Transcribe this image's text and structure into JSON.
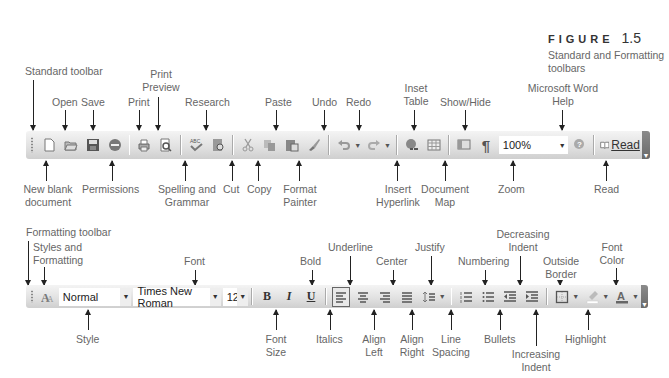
{
  "figure": {
    "label": "FIGURE",
    "number": "1.5",
    "caption": "Standard and Formatting toolbars"
  },
  "standard_toolbar": {
    "title": "Standard toolbar",
    "zoom_value": "100%",
    "read_label": "Read",
    "callouts_top": {
      "open": "Open",
      "save": "Save",
      "print": "Print",
      "print_preview": "Print Preview",
      "research": "Research",
      "paste": "Paste",
      "undo": "Undo",
      "redo": "Redo",
      "insert_table": "Inset Table",
      "show_hide": "Show/Hide",
      "help": "Microsoft Word Help"
    },
    "callouts_bottom": {
      "new_blank": "New blank document",
      "permissions": "Permissions",
      "spelling": "Spelling and Grammar",
      "cut": "Cut",
      "copy": "Copy",
      "format_painter": "Format Painter",
      "insert_hyperlink": "Insert Hyperlink",
      "document_map": "Document Map",
      "zoom": "Zoom",
      "read": "Read"
    }
  },
  "formatting_toolbar": {
    "title": "Formatting toolbar",
    "style_value": "Normal",
    "font_value": "Times New Roman",
    "size_value": "12",
    "callouts_top": {
      "styles_formatting": "Styles and Formatting",
      "font": "Font",
      "bold": "Bold",
      "underline": "Underline",
      "center": "Center",
      "justify": "Justify",
      "numbering": "Numbering",
      "decreasing_indent": "Decreasing Indent",
      "outside_border": "Outside Border",
      "font_color": "Font Color"
    },
    "callouts_bottom": {
      "style": "Style",
      "font_size": "Font Size",
      "italics": "Italics",
      "align_left": "Align Left",
      "align_right": "Align Right",
      "line_spacing": "Line Spacing",
      "bullets": "Bullets",
      "increasing_indent": "Increasing Indent",
      "highlight": "Highlight"
    }
  }
}
